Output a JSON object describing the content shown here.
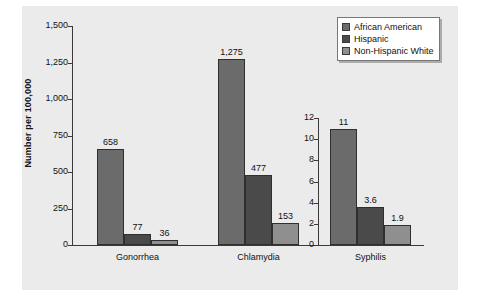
{
  "chart_data": {
    "type": "bar",
    "title": "",
    "xlabel": "",
    "ylabel": "Number per 100,000",
    "categories": [
      "Gonorrhea",
      "Chlamydia",
      "Syphilis"
    ],
    "series": [
      {
        "name": "African American",
        "color": "#6b6b6b",
        "values": [
          658,
          1275,
          11
        ]
      },
      {
        "name": "Hispanic",
        "color": "#4a4a4a",
        "values": [
          77,
          477,
          3.6
        ]
      },
      {
        "name": "Non-Hispanic White",
        "color": "#8f8f8f",
        "values": [
          36,
          153,
          1.9
        ]
      }
    ],
    "value_labels": {
      "Gonorrhea": [
        "658",
        "77",
        "36"
      ],
      "Chlamydia": [
        "1,275",
        "477",
        "153"
      ],
      "Syphilis": [
        "11",
        "3.6",
        "1.9"
      ]
    },
    "primary_axis": {
      "applies_to": [
        "Gonorrhea",
        "Chlamydia"
      ],
      "ylim": [
        0,
        1500
      ],
      "ticks": [
        0,
        250,
        500,
        750,
        1000,
        1250,
        1500
      ],
      "tick_labels": [
        "0",
        "250",
        "500",
        "750",
        "1,000",
        "1,250",
        "1,500"
      ]
    },
    "secondary_axis": {
      "applies_to": [
        "Syphilis"
      ],
      "ylim": [
        0,
        12
      ],
      "ticks": [
        0,
        2,
        4,
        6,
        8,
        10,
        12
      ],
      "tick_labels": [
        "0",
        "2",
        "4",
        "6",
        "8",
        "10",
        "12"
      ]
    },
    "grid": false,
    "legend_position": "top-right"
  },
  "legend": {
    "items": [
      {
        "label": "African American"
      },
      {
        "label": "Hispanic"
      },
      {
        "label": "Non-Hispanic White"
      }
    ]
  }
}
